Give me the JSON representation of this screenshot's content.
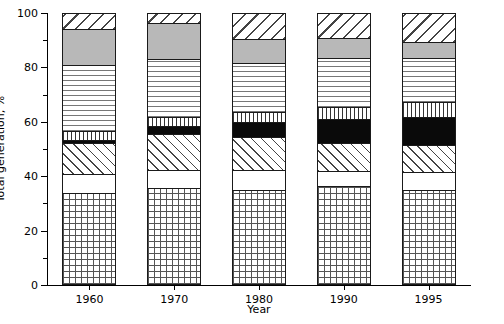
{
  "chart_data": {
    "type": "bar",
    "subtype": "stacked-bar-100-percent",
    "title": "",
    "xlabel": "Year",
    "ylabel": "Total generation, %",
    "categories": [
      "1960",
      "1970",
      "1980",
      "1990",
      "1995"
    ],
    "ylim": [
      0,
      100
    ],
    "ytick_labels": [
      "0",
      "20",
      "40",
      "60",
      "80",
      "100"
    ],
    "ytick_values": [
      0,
      20,
      40,
      60,
      80,
      100
    ],
    "yminor_values": [
      10,
      30,
      50,
      70,
      90
    ],
    "grid": false,
    "legend": "none",
    "stack_order": "bottom-to-top",
    "series": [
      {
        "name": "segment-1-grid",
        "pattern": "grid",
        "values": [
          33.8,
          35.7,
          34.9,
          36.4,
          34.9
        ]
      },
      {
        "name": "segment-2-blank",
        "pattern": "blank",
        "values": [
          7.0,
          6.6,
          7.4,
          5.5,
          6.6
        ]
      },
      {
        "name": "segment-3-diagonal",
        "pattern": "diagonal",
        "values": [
          11.4,
          13.2,
          12.1,
          10.3,
          9.9
        ]
      },
      {
        "name": "segment-4-black",
        "pattern": "solid-black",
        "values": [
          1.1,
          2.9,
          5.5,
          8.8,
          10.3
        ]
      },
      {
        "name": "segment-5-vertical",
        "pattern": "vertical",
        "values": [
          3.3,
          3.3,
          3.7,
          4.4,
          5.5
        ]
      },
      {
        "name": "segment-6-horizontal",
        "pattern": "horizontal",
        "values": [
          24.3,
          21.3,
          18.0,
          18.0,
          16.2
        ]
      },
      {
        "name": "segment-7-gray",
        "pattern": "solid-gray",
        "values": [
          13.2,
          13.2,
          8.8,
          7.4,
          5.9
        ]
      },
      {
        "name": "segment-8-diagonal-up",
        "pattern": "diagonal-up",
        "values": [
          5.9,
          3.8,
          9.6,
          9.2,
          10.7
        ]
      }
    ]
  },
  "axes": {
    "y_title": "Total generation, %",
    "x_title": "Year"
  }
}
